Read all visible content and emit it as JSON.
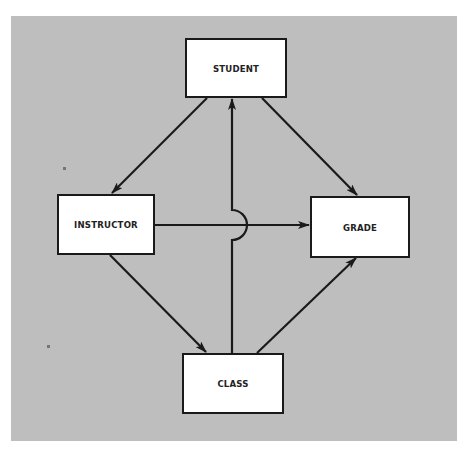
{
  "diagram": {
    "background_color": "#bebebe",
    "line_color": "#1a1a1a",
    "nodes": {
      "student": {
        "label": "STUDENT",
        "x": 185,
        "y": 38,
        "w": 102,
        "h": 60
      },
      "instructor": {
        "label": "INSTRUCTOR",
        "x": 57,
        "y": 194,
        "w": 98,
        "h": 61
      },
      "grade": {
        "label": "GRADE",
        "x": 310,
        "y": 196,
        "w": 100,
        "h": 62
      },
      "class": {
        "label": "CLASS",
        "x": 182,
        "y": 353,
        "w": 102,
        "h": 61
      }
    },
    "edges": [
      {
        "from": "STUDENT",
        "to": "INSTRUCTOR"
      },
      {
        "from": "STUDENT",
        "to": "GRADE"
      },
      {
        "from": "INSTRUCTOR",
        "to": "GRADE",
        "note": "crosses CLASS-STUDENT line via hop"
      },
      {
        "from": "INSTRUCTOR",
        "to": "CLASS"
      },
      {
        "from": "CLASS",
        "to": "GRADE"
      },
      {
        "from": "CLASS",
        "to": "STUDENT",
        "note": "vertical line with semicircular hop over INSTRUCTOR-GRADE line"
      }
    ]
  }
}
